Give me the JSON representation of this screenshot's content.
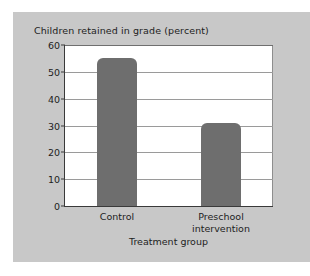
{
  "chart_data": {
    "type": "bar",
    "title": "Children retained in grade (percent)",
    "xlabel": "Treatment group",
    "ylabel": "",
    "categories": [
      "Control",
      "Preschool\nintervention"
    ],
    "values": [
      55,
      31
    ],
    "ylim": [
      0,
      60
    ],
    "yticks": [
      0,
      10,
      20,
      30,
      40,
      50,
      60
    ],
    "ytick_labels": [
      "0",
      "10",
      "20",
      "30",
      "40",
      "50",
      "60"
    ],
    "grid": true,
    "legend": "none",
    "bar_color": "#6e6e6e",
    "plot_background": "#ffffff",
    "panel_background": "#c8c8c8",
    "page_background": "#ffffff",
    "gridline_color": "#9a9a9a",
    "axis_color": "#3a3a3a",
    "text_color": "#1d1d1d"
  }
}
